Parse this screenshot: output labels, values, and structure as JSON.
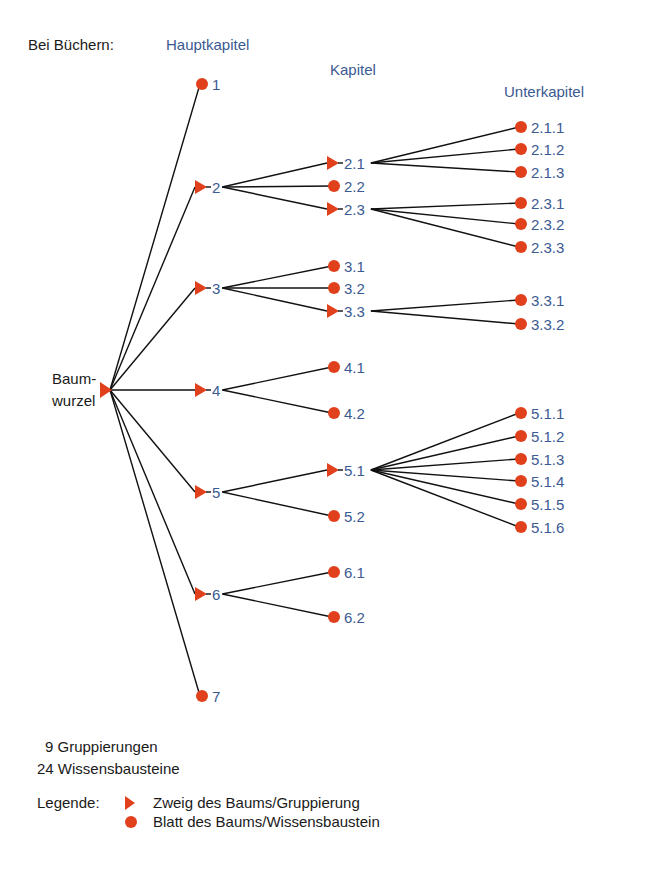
{
  "header": {
    "prefix": "Bei Büchern:"
  },
  "columns": {
    "level1": "Hauptkapitel",
    "level2": "Kapitel",
    "level3": "Unterkapitel"
  },
  "root": {
    "label_line1": "Baum-",
    "label_line2": "wurzel"
  },
  "nodes": [
    {
      "id": "1",
      "type": "leaf",
      "parent": "root",
      "x": 202,
      "y": 84
    },
    {
      "id": "2",
      "type": "branch",
      "parent": "root",
      "x": 202,
      "y": 187
    },
    {
      "id": "2.1",
      "type": "branch",
      "parent": "2",
      "x": 334,
      "y": 163
    },
    {
      "id": "2.2",
      "type": "leaf",
      "parent": "2",
      "x": 334,
      "y": 186
    },
    {
      "id": "2.3",
      "type": "branch",
      "parent": "2",
      "x": 334,
      "y": 209
    },
    {
      "id": "2.1.1",
      "type": "leaf",
      "parent": "2.1",
      "x": 521,
      "y": 127
    },
    {
      "id": "2.1.2",
      "type": "leaf",
      "parent": "2.1",
      "x": 521,
      "y": 149
    },
    {
      "id": "2.1.3",
      "type": "leaf",
      "parent": "2.1",
      "x": 521,
      "y": 172
    },
    {
      "id": "2.3.1",
      "type": "leaf",
      "parent": "2.3",
      "x": 521,
      "y": 203
    },
    {
      "id": "2.3.2",
      "type": "leaf",
      "parent": "2.3",
      "x": 521,
      "y": 224
    },
    {
      "id": "2.3.3",
      "type": "leaf",
      "parent": "2.3",
      "x": 521,
      "y": 247
    },
    {
      "id": "3",
      "type": "branch",
      "parent": "root",
      "x": 202,
      "y": 288
    },
    {
      "id": "3.1",
      "type": "leaf",
      "parent": "3",
      "x": 334,
      "y": 266
    },
    {
      "id": "3.2",
      "type": "leaf",
      "parent": "3",
      "x": 334,
      "y": 288
    },
    {
      "id": "3.3",
      "type": "branch",
      "parent": "3",
      "x": 334,
      "y": 311
    },
    {
      "id": "3.3.1",
      "type": "leaf",
      "parent": "3.3",
      "x": 521,
      "y": 300
    },
    {
      "id": "3.3.2",
      "type": "leaf",
      "parent": "3.3",
      "x": 521,
      "y": 324
    },
    {
      "id": "4",
      "type": "branch",
      "parent": "root",
      "x": 202,
      "y": 390
    },
    {
      "id": "4.1",
      "type": "leaf",
      "parent": "4",
      "x": 334,
      "y": 367
    },
    {
      "id": "4.2",
      "type": "leaf",
      "parent": "4",
      "x": 334,
      "y": 413
    },
    {
      "id": "5",
      "type": "branch",
      "parent": "root",
      "x": 202,
      "y": 492
    },
    {
      "id": "5.1",
      "type": "branch",
      "parent": "5",
      "x": 334,
      "y": 470
    },
    {
      "id": "5.2",
      "type": "leaf",
      "parent": "5",
      "x": 334,
      "y": 516
    },
    {
      "id": "5.1.1",
      "type": "leaf",
      "parent": "5.1",
      "x": 521,
      "y": 413
    },
    {
      "id": "5.1.2",
      "type": "leaf",
      "parent": "5.1",
      "x": 521,
      "y": 436
    },
    {
      "id": "5.1.3",
      "type": "leaf",
      "parent": "5.1",
      "x": 521,
      "y": 459
    },
    {
      "id": "5.1.4",
      "type": "leaf",
      "parent": "5.1",
      "x": 521,
      "y": 481
    },
    {
      "id": "5.1.5",
      "type": "leaf",
      "parent": "5.1",
      "x": 521,
      "y": 504
    },
    {
      "id": "5.1.6",
      "type": "leaf",
      "parent": "5.1",
      "x": 521,
      "y": 527
    },
    {
      "id": "6",
      "type": "branch",
      "parent": "root",
      "x": 202,
      "y": 594
    },
    {
      "id": "6.1",
      "type": "leaf",
      "parent": "6",
      "x": 334,
      "y": 572
    },
    {
      "id": "6.2",
      "type": "leaf",
      "parent": "6",
      "x": 334,
      "y": 617
    },
    {
      "id": "7",
      "type": "leaf",
      "parent": "root",
      "x": 202,
      "y": 696
    }
  ],
  "summary": {
    "groups": "9 Gruppierungen",
    "blocks": "24 Wissensbausteine"
  },
  "legend": {
    "title": "Legende:",
    "branch_label": "Zweig des Baums/Gruppierung",
    "leaf_label": "Blatt des Baums/Wissensbaustein"
  },
  "colors": {
    "marker": "#e0401c",
    "label": "#3b5a92",
    "text": "#1a1a1a",
    "edge": "#111111"
  }
}
